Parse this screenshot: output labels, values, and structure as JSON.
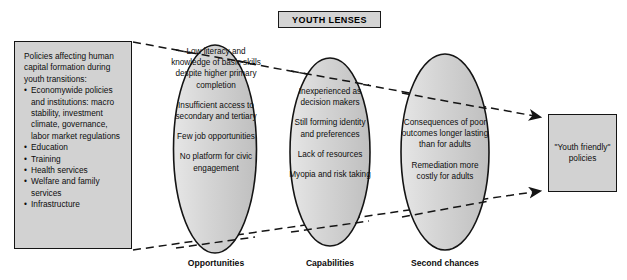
{
  "figure": {
    "title": "YOUTH LENSES",
    "background_color": "#ffffff",
    "shape_fill": "#d2d2d2",
    "shape_stroke": "#141414"
  },
  "policy_box": {
    "intro": "Policies affecting human capital formation during youth transitions:",
    "items": [
      "Economywide policies and institutions: macro stability, investment climate, governance, labor market regulations",
      "Education",
      "Training",
      "Health services",
      "Welfare and family services",
      "Infrastructure"
    ]
  },
  "lenses": [
    {
      "caption": "Opportunities",
      "points": [
        "Low literacy and knowledge of basic skills despite higher primary completion",
        "Insufficient access to secondary and tertiary",
        "Few job opportunities",
        "No platform for civic engagement"
      ]
    },
    {
      "caption": "Capabilities",
      "points": [
        "Inexperienced as decision makers",
        "Still forming identity and preferences",
        "Lack of resources",
        "Myopia and risk taking"
      ]
    },
    {
      "caption": "Second chances",
      "points": [
        "Consequences of poor outcomes longer lasting than for adults",
        "Remediation more costly for adults"
      ]
    }
  ],
  "outcome_box": {
    "text": "\"Youth friendly\" policies"
  }
}
